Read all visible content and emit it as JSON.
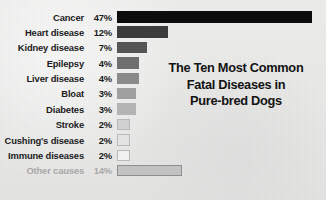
{
  "chart_data": {
    "type": "bar",
    "orientation": "horizontal",
    "title": "The Ten Most Common Fatal Diseases in Pure-bred Dogs",
    "title_lines": [
      "The Ten Most Common",
      "Fatal Diseases in",
      "Pure-bred Dogs"
    ],
    "xlabel": "",
    "ylabel": "",
    "xlim": [
      0,
      47
    ],
    "grid": false,
    "legend": null,
    "categories": [
      "Cancer",
      "Heart disease",
      "Kidney disease",
      "Epilepsy",
      "Liver disease",
      "Bloat",
      "Diabetes",
      "Stroke",
      "Cushing's disease",
      "Immune diseases",
      "Other causes"
    ],
    "values": [
      47,
      12,
      7,
      4,
      4,
      3,
      3,
      2,
      2,
      2,
      14
    ],
    "value_labels": [
      "47%",
      "12%",
      "7%",
      "4%",
      "4%",
      "3%",
      "3%",
      "2%",
      "2%",
      "2%",
      "14%"
    ],
    "bar_colors": [
      "#0a0a0a",
      "#3b3b3b",
      "#545454",
      "#6e6e6e",
      "#8a8a8a",
      "#a0a0a0",
      "#b4b4b4",
      "#d2d2d2",
      "#e4e4e4",
      "#f2f2f2",
      "#c2c2c2"
    ],
    "bar_border_colors": [
      "#0a0a0a",
      "#3b3b3b",
      "#545454",
      "#6e6e6e",
      "#8a8a8a",
      "#a0a0a0",
      "#b4b4b4",
      "#b9b9b9",
      "#b9b9b9",
      "#b9b9b9",
      "#8f8f8f"
    ],
    "muted_rows": [
      10
    ],
    "bar_pixel_widths": [
      195,
      51,
      30,
      22,
      22,
      19,
      19,
      13,
      13,
      13,
      65
    ],
    "background_color": "#e9e9e9",
    "label_color": "#1a1a1a",
    "muted_label_color": "#a8a8a8"
  }
}
